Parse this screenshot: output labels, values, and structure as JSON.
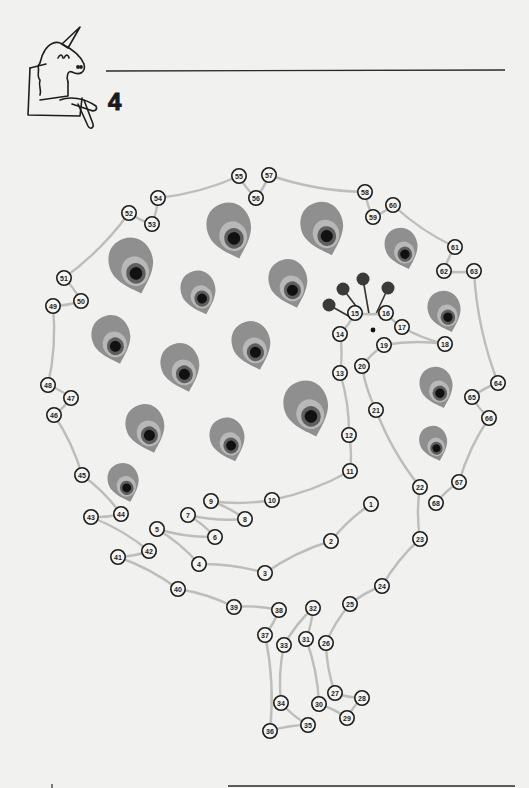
{
  "page": {
    "number": "4",
    "title_line": "",
    "mascot": "unicorn-icon"
  },
  "colors": {
    "background": "#f1f1ef",
    "connector_line": "#bdbdbb",
    "dot_outline": "#1b1b1b",
    "feather_outer": "#8f8f8f",
    "feather_ring": "#b8b8b8",
    "feather_inner": "#5e5e5e",
    "feather_center": "#111111",
    "crest_ball": "#3a3a3a"
  },
  "puzzle": {
    "type": "connect-the-dots",
    "subject": "peacock",
    "dots": [
      {
        "n": "1",
        "x": 371,
        "y": 504
      },
      {
        "n": "2",
        "x": 331,
        "y": 541
      },
      {
        "n": "3",
        "x": 265,
        "y": 573
      },
      {
        "n": "4",
        "x": 199,
        "y": 564
      },
      {
        "n": "5",
        "x": 157,
        "y": 529
      },
      {
        "n": "6",
        "x": 215,
        "y": 537
      },
      {
        "n": "7",
        "x": 188,
        "y": 515
      },
      {
        "n": "8",
        "x": 245,
        "y": 519
      },
      {
        "n": "9",
        "x": 211,
        "y": 501
      },
      {
        "n": "10",
        "x": 272,
        "y": 500
      },
      {
        "n": "11",
        "x": 350,
        "y": 471
      },
      {
        "n": "12",
        "x": 349,
        "y": 435
      },
      {
        "n": "13",
        "x": 340,
        "y": 373
      },
      {
        "n": "14",
        "x": 340,
        "y": 334
      },
      {
        "n": "15",
        "x": 355,
        "y": 313
      },
      {
        "n": "16",
        "x": 386,
        "y": 313
      },
      {
        "n": "17",
        "x": 402,
        "y": 327
      },
      {
        "n": "18",
        "x": 445,
        "y": 344
      },
      {
        "n": "19",
        "x": 384,
        "y": 345
      },
      {
        "n": "20",
        "x": 362,
        "y": 366
      },
      {
        "n": "21",
        "x": 376,
        "y": 410
      },
      {
        "n": "22",
        "x": 420,
        "y": 487
      },
      {
        "n": "23",
        "x": 420,
        "y": 539
      },
      {
        "n": "24",
        "x": 382,
        "y": 586
      },
      {
        "n": "25",
        "x": 350,
        "y": 604
      },
      {
        "n": "26",
        "x": 326,
        "y": 643
      },
      {
        "n": "27",
        "x": 335,
        "y": 693
      },
      {
        "n": "28",
        "x": 362,
        "y": 698
      },
      {
        "n": "29",
        "x": 347,
        "y": 718
      },
      {
        "n": "30",
        "x": 319,
        "y": 704
      },
      {
        "n": "31",
        "x": 306,
        "y": 639
      },
      {
        "n": "32",
        "x": 313,
        "y": 608
      },
      {
        "n": "33",
        "x": 284,
        "y": 645
      },
      {
        "n": "34",
        "x": 281,
        "y": 703
      },
      {
        "n": "35",
        "x": 308,
        "y": 725
      },
      {
        "n": "36",
        "x": 270,
        "y": 731
      },
      {
        "n": "37",
        "x": 265,
        "y": 635
      },
      {
        "n": "38",
        "x": 279,
        "y": 610
      },
      {
        "n": "39",
        "x": 234,
        "y": 607
      },
      {
        "n": "40",
        "x": 178,
        "y": 589
      },
      {
        "n": "41",
        "x": 118,
        "y": 557
      },
      {
        "n": "42",
        "x": 149,
        "y": 551
      },
      {
        "n": "43",
        "x": 91,
        "y": 517
      },
      {
        "n": "44",
        "x": 121,
        "y": 514
      },
      {
        "n": "45",
        "x": 82,
        "y": 475
      },
      {
        "n": "46",
        "x": 54,
        "y": 415
      },
      {
        "n": "47",
        "x": 71,
        "y": 398
      },
      {
        "n": "48",
        "x": 48,
        "y": 385
      },
      {
        "n": "49",
        "x": 53,
        "y": 306
      },
      {
        "n": "50",
        "x": 81,
        "y": 301
      },
      {
        "n": "51",
        "x": 64,
        "y": 278
      },
      {
        "n": "52",
        "x": 129,
        "y": 213
      },
      {
        "n": "53",
        "x": 152,
        "y": 224
      },
      {
        "n": "54",
        "x": 158,
        "y": 198
      },
      {
        "n": "55",
        "x": 239,
        "y": 176
      },
      {
        "n": "56",
        "x": 256,
        "y": 198
      },
      {
        "n": "57",
        "x": 269,
        "y": 175
      },
      {
        "n": "58",
        "x": 365,
        "y": 192
      },
      {
        "n": "59",
        "x": 373,
        "y": 217
      },
      {
        "n": "60",
        "x": 393,
        "y": 205
      },
      {
        "n": "61",
        "x": 455,
        "y": 247
      },
      {
        "n": "62",
        "x": 444,
        "y": 271
      },
      {
        "n": "63",
        "x": 474,
        "y": 271
      },
      {
        "n": "64",
        "x": 498,
        "y": 383
      },
      {
        "n": "65",
        "x": 472,
        "y": 397
      },
      {
        "n": "66",
        "x": 489,
        "y": 418
      },
      {
        "n": "67",
        "x": 459,
        "y": 482
      },
      {
        "n": "68",
        "x": 436,
        "y": 503
      }
    ],
    "feathers": [
      {
        "x": 230,
        "y": 230,
        "s": 1.15
      },
      {
        "x": 323,
        "y": 228,
        "s": 1.1
      },
      {
        "x": 402,
        "y": 248,
        "s": 0.85
      },
      {
        "x": 132,
        "y": 265,
        "s": 1.15
      },
      {
        "x": 199,
        "y": 292,
        "s": 0.9
      },
      {
        "x": 289,
        "y": 283,
        "s": 1.0
      },
      {
        "x": 445,
        "y": 311,
        "s": 0.85
      },
      {
        "x": 112,
        "y": 339,
        "s": 1.0
      },
      {
        "x": 181,
        "y": 367,
        "s": 1.0
      },
      {
        "x": 252,
        "y": 345,
        "s": 1.0
      },
      {
        "x": 307,
        "y": 408,
        "s": 1.15
      },
      {
        "x": 437,
        "y": 387,
        "s": 0.85
      },
      {
        "x": 146,
        "y": 428,
        "s": 1.0
      },
      {
        "x": 228,
        "y": 439,
        "s": 0.9
      },
      {
        "x": 434,
        "y": 443,
        "s": 0.72
      },
      {
        "x": 124,
        "y": 482,
        "s": 0.8
      }
    ],
    "head": {
      "eye": {
        "x": 373,
        "y": 330
      },
      "crest": [
        {
          "bx": 329,
          "by": 305,
          "tx": 352,
          "ty": 318
        },
        {
          "bx": 343,
          "by": 289,
          "tx": 362,
          "ty": 314
        },
        {
          "bx": 363,
          "by": 279,
          "tx": 369,
          "ty": 314
        },
        {
          "bx": 388,
          "by": 288,
          "tx": 376,
          "ty": 314
        }
      ]
    }
  }
}
